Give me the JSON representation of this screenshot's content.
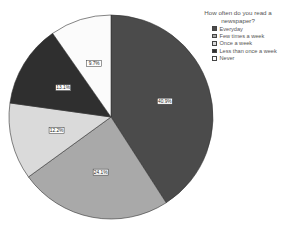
{
  "chart_data": {
    "type": "pie",
    "title": "",
    "legend_title": [
      "How often do you read a",
      "newspaper?"
    ],
    "legend_position": "right-top",
    "categories": [
      "Everyday",
      "Few times a week",
      "Once a week",
      "Less than once a week",
      "Never"
    ],
    "values": [
      40.9,
      24.1,
      12.2,
      13.1,
      9.7
    ],
    "labels": [
      "40.9%",
      "24.1%",
      "12.2%",
      "13.1%",
      "9.7%"
    ],
    "colors": [
      "#4b4b4b",
      "#a9a9a9",
      "#dadada",
      "#2f2f2f",
      "#fbfbfb"
    ],
    "start_angle_deg": 0,
    "direction": "clockwise"
  },
  "legend": {
    "title_line1": "How often do you read a",
    "title_line2": "newspaper?",
    "items": [
      {
        "label": "Everyday"
      },
      {
        "label": "Few times a week"
      },
      {
        "label": "Once a week"
      },
      {
        "label": "Less than once a week"
      },
      {
        "label": "Never"
      }
    ]
  }
}
